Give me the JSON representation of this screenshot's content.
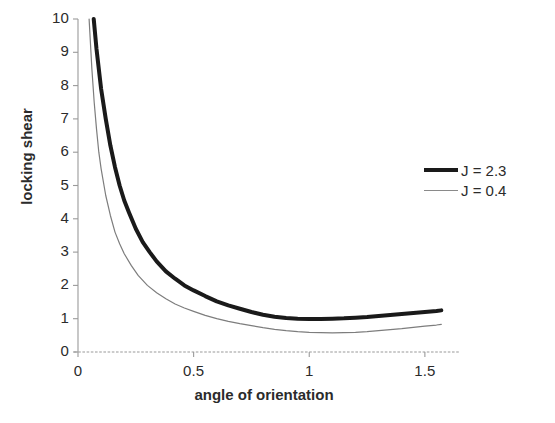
{
  "chart_data": {
    "type": "line",
    "title": "",
    "xlabel": "angle of orientation",
    "ylabel": "locking shear",
    "xlim": [
      0,
      1.6
    ],
    "ylim": [
      0,
      10
    ],
    "grid": false,
    "legend_position": "right",
    "xticks": [
      "0",
      "0.5",
      "1",
      "1.5"
    ],
    "xtick_values": [
      0,
      0.5,
      1,
      1.5
    ],
    "yticks": [
      "0",
      "1",
      "2",
      "3",
      "4",
      "5",
      "6",
      "7",
      "8",
      "9",
      "10"
    ],
    "ytick_values": [
      0,
      1,
      2,
      3,
      4,
      5,
      6,
      7,
      8,
      9,
      10
    ],
    "series": [
      {
        "name": "J = 2.3",
        "style": "thick",
        "color": "#1a1a1a",
        "width": 4,
        "x": [
          0.068,
          0.08,
          0.1,
          0.12,
          0.14,
          0.16,
          0.18,
          0.2,
          0.22,
          0.25,
          0.28,
          0.31,
          0.34,
          0.38,
          0.42,
          0.46,
          0.5,
          0.55,
          0.6,
          0.65,
          0.7,
          0.75,
          0.8,
          0.85,
          0.9,
          0.95,
          1.0,
          1.05,
          1.1,
          1.15,
          1.2,
          1.25,
          1.3,
          1.35,
          1.4,
          1.45,
          1.5,
          1.55,
          1.571
        ],
        "y": [
          10.0,
          9.1,
          7.9,
          7.0,
          6.2,
          5.55,
          5.0,
          4.55,
          4.2,
          3.7,
          3.3,
          3.0,
          2.72,
          2.42,
          2.2,
          2.0,
          1.85,
          1.68,
          1.52,
          1.4,
          1.3,
          1.2,
          1.12,
          1.06,
          1.02,
          1.0,
          0.99,
          0.99,
          1.0,
          1.01,
          1.03,
          1.05,
          1.08,
          1.11,
          1.14,
          1.17,
          1.2,
          1.23,
          1.25
        ]
      },
      {
        "name": "J = 0.4",
        "style": "thin",
        "color": "#7d7d7d",
        "width": 1.2,
        "x": [
          0.048,
          0.06,
          0.07,
          0.08,
          0.09,
          0.1,
          0.12,
          0.14,
          0.16,
          0.18,
          0.2,
          0.23,
          0.26,
          0.3,
          0.34,
          0.38,
          0.42,
          0.46,
          0.5,
          0.55,
          0.6,
          0.65,
          0.7,
          0.75,
          0.8,
          0.85,
          0.9,
          0.95,
          1.0,
          1.05,
          1.1,
          1.15,
          1.2,
          1.25,
          1.3,
          1.35,
          1.4,
          1.45,
          1.5,
          1.55,
          1.571
        ],
        "y": [
          10.0,
          8.5,
          7.5,
          6.7,
          6.0,
          5.5,
          4.7,
          4.1,
          3.6,
          3.25,
          2.95,
          2.6,
          2.3,
          2.0,
          1.78,
          1.6,
          1.44,
          1.32,
          1.22,
          1.1,
          1.0,
          0.92,
          0.85,
          0.79,
          0.73,
          0.68,
          0.64,
          0.61,
          0.59,
          0.58,
          0.575,
          0.58,
          0.59,
          0.61,
          0.64,
          0.67,
          0.7,
          0.74,
          0.78,
          0.81,
          0.83
        ]
      }
    ]
  },
  "legend": {
    "items": [
      {
        "label": "J = 2.3"
      },
      {
        "label": "J = 0.4"
      }
    ]
  },
  "axes": {
    "x_title": "angle of orientation",
    "y_title": "locking shear"
  },
  "colors": {
    "background": "#ffffff",
    "axis": "#8e8e8e",
    "text": "#2b2b2b",
    "series_thick": "#1a1a1a",
    "series_thin": "#7d7d7d"
  }
}
